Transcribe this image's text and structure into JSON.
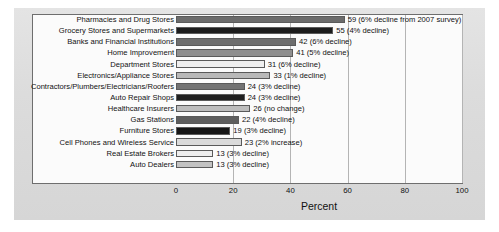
{
  "chart_data": {
    "type": "bar",
    "orientation": "horizontal",
    "title": "",
    "xlabel": "Percent",
    "ylabel": "",
    "xlim": [
      0,
      100
    ],
    "xticks": [
      0,
      20,
      40,
      60,
      80,
      100
    ],
    "grid": true,
    "legend": "none",
    "categories": [
      "Pharmacies and Drug Stores",
      "Grocery Stores and Supermarkets",
      "Banks and Financial Institutions",
      "Home Improvement",
      "Department Stores",
      "Electronics/Appliance Stores",
      "Contractors/Plumbers/Electricians/Roofers",
      "Auto Repair Shops",
      "Healthcare Insurers",
      "Gas Stations",
      "Furniture Stores",
      "Cell Phones and Wireless Service",
      "Real Estate Brokers",
      "Auto Dealers"
    ],
    "values": [
      59,
      55,
      42,
      41,
      31,
      33,
      24,
      24,
      26,
      22,
      19,
      23,
      13,
      13
    ],
    "value_labels": [
      "59 (6% decline from 2007 survey)",
      "55 (4% decline)",
      "42 (6% decline)",
      "41 (5% decline)",
      "31 (6% decline)",
      "33 (1% decline)",
      "24 (3% decline)",
      "24 (3% decline)",
      "26 (no change)",
      "22 (4% decline)",
      "19 (3% decline)",
      "23 (2% increase)",
      "13 (3% decline)",
      "13 (3% decline)"
    ],
    "bar_colors": [
      "#6b6b6b",
      "#1c1c1c",
      "#6e6e6e",
      "#8e8e8e",
      "#efefef",
      "#b9b9b9",
      "#737373",
      "#1f1f1f",
      "#bdbdbd",
      "#5e5e5e",
      "#161616",
      "#dadada",
      "#ededed",
      "#c2c2c2"
    ]
  }
}
